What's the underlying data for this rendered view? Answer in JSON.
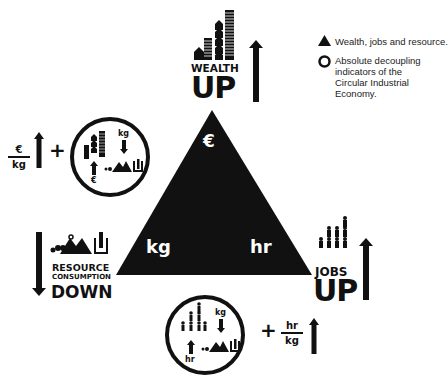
{
  "legend": {
    "items": [
      {
        "icon": "triangle-icon",
        "label": "Wealth, jobs and resource."
      },
      {
        "icon": "circle-icon",
        "label": "Absolute decoupling indicators of the Circular Industrial Economy."
      }
    ]
  },
  "triangle": {
    "top_label": "€",
    "bottom_left_label": "kg",
    "bottom_right_label": "hr",
    "color": "#111111"
  },
  "wealth": {
    "line1": "WEALTH",
    "line2": "UP",
    "arrow": "up"
  },
  "jobs": {
    "line1": "JOBS",
    "line2": "UP",
    "arrow": "up"
  },
  "resource": {
    "line1": "RESOURCE",
    "line2": "CONSUMPTION",
    "line3": "DOWN",
    "arrow": "down"
  },
  "indicator_left": {
    "fraction_numerator": "€",
    "fraction_denominator": "kg",
    "plus": "+",
    "circle_top_label": "kg",
    "circle_bottom_label": "€"
  },
  "indicator_bottom": {
    "fraction_numerator": "hr",
    "fraction_denominator": "kg",
    "plus": "+",
    "circle_top_label": "kg",
    "circle_bottom_label": "hr"
  }
}
